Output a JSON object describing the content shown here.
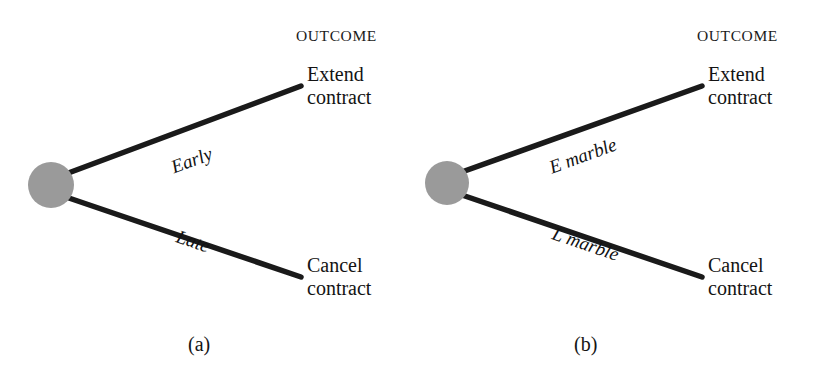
{
  "figure": {
    "width": 822,
    "height": 377,
    "background": "#ffffff",
    "line_color": "#1a1a1a",
    "node_fill": "#9a9a9a",
    "text_color": "#151515"
  },
  "panels": [
    {
      "id": "panel-a",
      "caption": "(a)",
      "outcome_heading": "OUTCOME",
      "node": {
        "label": "decision-node",
        "cx": 51,
        "cy": 185,
        "r": 23
      },
      "branches": [
        {
          "id": "branch-upper",
          "label": "Early",
          "leaf": [
            "Extend",
            "contract"
          ],
          "x1": 63,
          "y1": 175,
          "x2": 301,
          "y2": 86,
          "label_x": 172,
          "label_y": 157,
          "label_rot": -20.5
        },
        {
          "id": "branch-lower",
          "label": "Late",
          "leaf": [
            "Cancel",
            "contract"
          ],
          "x1": 63,
          "y1": 196,
          "x2": 301,
          "y2": 277,
          "label_x": 177,
          "label_y": 225,
          "label_rot": 19.0
        }
      ]
    },
    {
      "id": "panel-b",
      "caption": "(b)",
      "outcome_heading": "OUTCOME",
      "node": {
        "label": "chance-node",
        "cx": 36,
        "cy": 183,
        "r": 22
      },
      "branches": [
        {
          "id": "branch-upper",
          "label": "E marble",
          "leaf": [
            "Extend",
            "contract"
          ],
          "x1": 48,
          "y1": 173,
          "x2": 291,
          "y2": 86,
          "label_x": 139,
          "label_y": 157,
          "label_rot": -20.0
        },
        {
          "id": "branch-lower",
          "label": "L marble",
          "leaf": [
            "Cancel",
            "contract"
          ],
          "x1": 48,
          "y1": 194,
          "x2": 291,
          "y2": 277,
          "label_x": 142,
          "label_y": 222,
          "label_rot": 19.0
        }
      ]
    }
  ],
  "geometry": {
    "outcome_heading_x": 296,
    "outcome_heading_y": 27,
    "leaf_text_x": 307,
    "leaf_upper_y": 63,
    "leaf_lower_y": 254,
    "caption_a_x": 188,
    "caption_b_x": 574,
    "caption_y": 333,
    "line_width": 5.5
  }
}
